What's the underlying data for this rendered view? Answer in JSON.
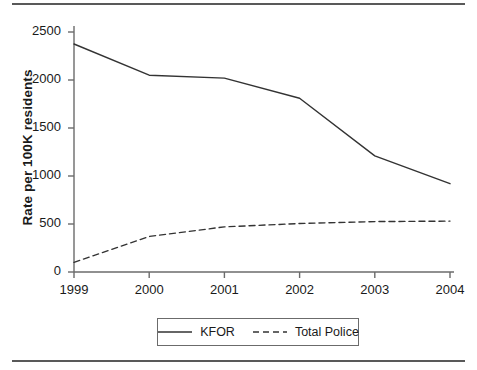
{
  "figure": {
    "ylabel": "Rate per 100K residents",
    "rules": {
      "top": "divider-top",
      "bottom": "divider-bottom"
    }
  },
  "axes": {
    "y_ticks": [
      "0",
      "500",
      "1000",
      "1500",
      "2000",
      "2500"
    ],
    "x_ticks": [
      "1999",
      "2000",
      "2001",
      "2002",
      "2003",
      "2004"
    ]
  },
  "legend": {
    "items": [
      {
        "label": "KFOR",
        "style": "solid",
        "color": "#333333"
      },
      {
        "label": "Total Police",
        "style": "dashed",
        "color": "#333333"
      }
    ]
  },
  "chart_data": {
    "type": "line",
    "title": "",
    "xlabel": "",
    "ylabel": "Rate per 100K residents",
    "x": [
      1999,
      2000,
      2001,
      2002,
      2003,
      2004
    ],
    "categories": [
      "1999",
      "2000",
      "2001",
      "2002",
      "2003",
      "2004"
    ],
    "series": [
      {
        "name": "KFOR",
        "style": "solid",
        "color": "#333333",
        "values": [
          2375,
          2050,
          2020,
          1810,
          1210,
          920
        ]
      },
      {
        "name": "Total Police",
        "style": "dashed",
        "color": "#333333",
        "values": [
          100,
          370,
          470,
          505,
          525,
          530
        ]
      }
    ],
    "xlim": [
      1999,
      2004
    ],
    "ylim": [
      0,
      2500
    ],
    "ytick_values": [
      0,
      500,
      1000,
      1500,
      2000,
      2500
    ],
    "grid": false,
    "legend_position": "bottom-center"
  }
}
